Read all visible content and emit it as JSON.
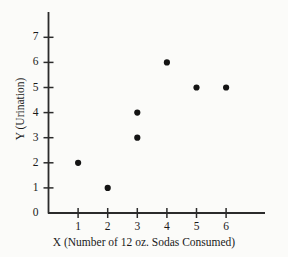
{
  "chart_data": {
    "type": "scatter",
    "title": "",
    "xlabel": "X (Number of 12 oz. Sodas Consumed)",
    "ylabel": "Y (Urination)",
    "xlim": [
      0,
      7.35
    ],
    "ylim": [
      0,
      7.6
    ],
    "xticks": [
      1,
      2,
      3,
      4,
      5,
      6
    ],
    "yticks": [
      0,
      1,
      2,
      3,
      4,
      5,
      6,
      7
    ],
    "xtick_labels": [
      "1",
      "2",
      "3",
      "4",
      "5",
      "6"
    ],
    "ytick_labels": [
      "0",
      "1",
      "2",
      "3",
      "4",
      "5",
      "6",
      "7"
    ],
    "grid": false,
    "legend": false,
    "marker": "filled-circle",
    "marker_color": "#141414",
    "axis_color": "#2b2b2b",
    "background_color": "#fbfbf9",
    "points": [
      {
        "x": 1,
        "y": 2
      },
      {
        "x": 2,
        "y": 1
      },
      {
        "x": 3,
        "y": 3
      },
      {
        "x": 3,
        "y": 4
      },
      {
        "x": 4,
        "y": 6
      },
      {
        "x": 5,
        "y": 5
      },
      {
        "x": 6,
        "y": 5
      }
    ]
  }
}
